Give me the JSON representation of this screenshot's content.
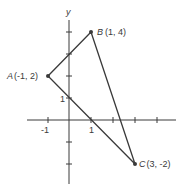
{
  "axes": {
    "y_label": "y",
    "x_ticks": [
      "-1",
      "1"
    ],
    "y_ticks": [
      "1"
    ]
  },
  "points": [
    {
      "name": "A",
      "coords": "(-1, 2)",
      "x": -1,
      "y": 2
    },
    {
      "name": "B",
      "coords": "(1, 4)",
      "x": 1,
      "y": 4
    },
    {
      "name": "C",
      "coords": "(3, -2)",
      "x": 3,
      "y": -2
    }
  ],
  "colors": {
    "line": "#3a3a3a",
    "background": "#ffffff"
  }
}
